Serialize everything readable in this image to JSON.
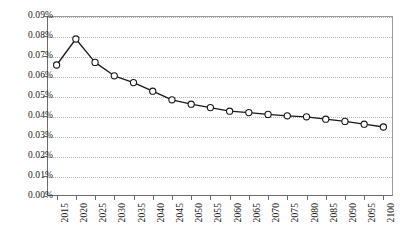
{
  "chart_data": {
    "type": "line",
    "title": "",
    "subtitle": "",
    "xlabel": "",
    "ylabel": "",
    "categories": [
      "2015",
      "2020",
      "2025",
      "2030",
      "2035",
      "2040",
      "2045",
      "2050",
      "2055",
      "2060",
      "2065",
      "2070",
      "2075",
      "2080",
      "2085",
      "2090",
      "2095",
      "2100"
    ],
    "values": [
      0.0655,
      0.0785,
      0.0668,
      0.0601,
      0.0567,
      0.0524,
      0.0481,
      0.0459,
      0.0442,
      0.0424,
      0.0417,
      0.0408,
      0.0401,
      0.0396,
      0.0384,
      0.0373,
      0.0359,
      0.0345
    ],
    "value_unit": "%",
    "ylim": [
      0.0,
      0.09
    ],
    "ytick_labels": [
      "0.00%",
      "0.01%",
      "0.02%",
      "0.03%",
      "0.04%",
      "0.05%",
      "0.06%",
      "0.07%",
      "0.08%",
      "0.09%"
    ],
    "ytick_values": [
      0.0,
      0.01,
      0.02,
      0.03,
      0.04,
      0.05,
      0.06,
      0.07,
      0.08,
      0.09
    ],
    "grid": true,
    "grid_style": "dotted",
    "grid_color": "#b7b7b7",
    "legend": false,
    "legend_position": "none",
    "series": [
      {
        "name": "",
        "line_color": "#1a1a1a",
        "marker": "open-circle",
        "marker_fill": "#ffffff",
        "marker_edge_color": "#1a1a1a",
        "values": [
          0.0655,
          0.0785,
          0.0668,
          0.0601,
          0.0567,
          0.0524,
          0.0481,
          0.0459,
          0.0442,
          0.0424,
          0.0417,
          0.0408,
          0.0401,
          0.0396,
          0.0384,
          0.0373,
          0.0359,
          0.0345
        ]
      }
    ]
  },
  "axes": {
    "y_axis_name": "y-axis",
    "x_axis_name": "x-axis",
    "axis_color": "#6b6b6b",
    "x_tick_rotation": "90"
  },
  "plot": {
    "background": "#ffffff",
    "border_color": "#9a9a9a"
  }
}
